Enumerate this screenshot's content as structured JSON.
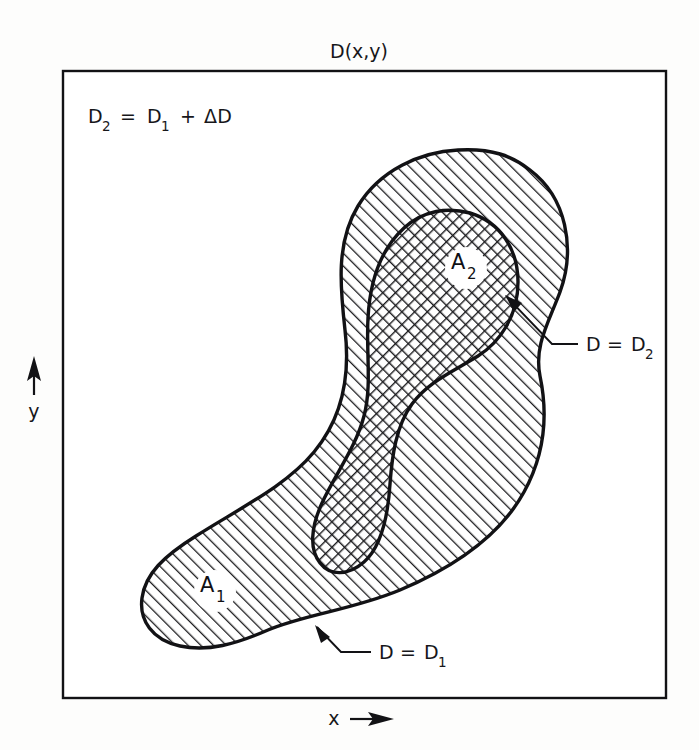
{
  "figure": {
    "title": "D(x,y)",
    "equation": {
      "lhs_base": "D",
      "lhs_sub": "2",
      "operator": "=",
      "rhs_base": "D",
      "rhs_sub": "1",
      "plus": "+",
      "delta_term": "ΔD"
    },
    "axes": {
      "x_label": "x",
      "y_label": "y",
      "x_arrow": "right-arrow",
      "y_arrow": "up-arrow"
    },
    "regions": [
      {
        "id": "outer",
        "label_base": "A",
        "label_sub": "1",
        "fill_pattern": "diagonal-hatch",
        "description": "Region enclosed by contour D = D1, single diagonal hatching"
      },
      {
        "id": "inner",
        "label_base": "A",
        "label_sub": "2",
        "fill_pattern": "cross-hatch",
        "description": "Region enclosed by contour D = D2, cross hatching"
      }
    ],
    "annotations": [
      {
        "id": "contour-d2",
        "base": "D",
        "operator": "=",
        "value_base": "D",
        "value_sub": "2",
        "leader": "line-with-arrow"
      },
      {
        "id": "contour-d1",
        "base": "D",
        "operator": "=",
        "value_base": "D",
        "value_sub": "1",
        "leader": "line-with-arrow"
      }
    ],
    "colors": {
      "ink": "#121215",
      "background": "#fdfdfc",
      "hatch": "#17171a",
      "label_halo": "#ffffff"
    },
    "frame": {
      "left": 63,
      "top": 71,
      "right": 666,
      "bottom": 698
    }
  }
}
